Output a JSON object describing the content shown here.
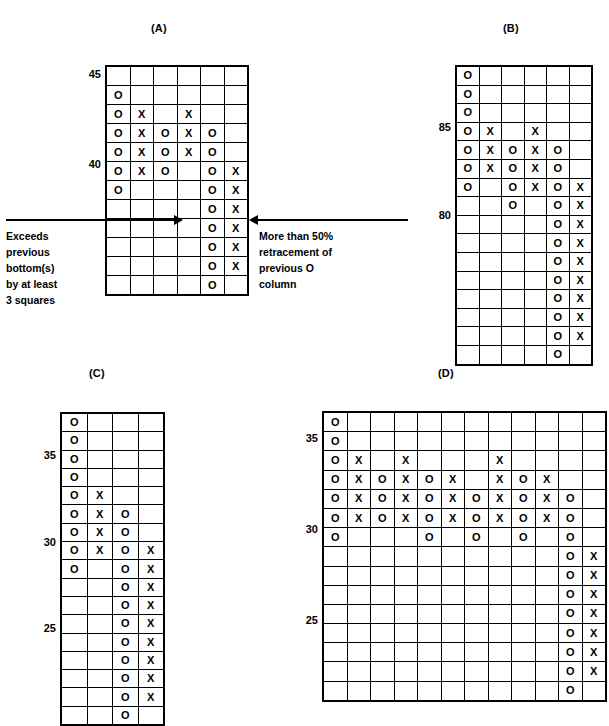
{
  "figure": {
    "type": "point-and-figure-charts",
    "panels": [
      {
        "id": "A",
        "title": "(A)",
        "columns": 6,
        "rows": 12,
        "scale_labels": [
          {
            "text": "45",
            "row": 0
          },
          {
            "text": "40",
            "row": 5
          }
        ],
        "cells": [
          [
            "",
            "",
            "",
            "",
            "",
            ""
          ],
          [
            "O",
            "",
            "",
            "",
            "",
            ""
          ],
          [
            "O",
            "X",
            "",
            "X",
            "",
            ""
          ],
          [
            "O",
            "X",
            "O",
            "X",
            "O",
            ""
          ],
          [
            "O",
            "X",
            "O",
            "X",
            "O",
            ""
          ],
          [
            "O",
            "X",
            "O",
            "",
            "O",
            "X"
          ],
          [
            "O",
            "",
            "",
            "",
            "O",
            "X"
          ],
          [
            "",
            "",
            "",
            "",
            "O",
            "X"
          ],
          [
            "",
            "",
            "",
            "",
            "O",
            "X"
          ],
          [
            "",
            "",
            "",
            "",
            "O",
            "X"
          ],
          [
            "",
            "",
            "",
            "",
            "O",
            "X"
          ],
          [
            "",
            "",
            "",
            "",
            "O",
            ""
          ]
        ]
      },
      {
        "id": "B",
        "title": "(B)",
        "columns": 6,
        "rows": 16,
        "scale_labels": [
          {
            "text": "85",
            "row": 3
          },
          {
            "text": "80",
            "row": 8
          }
        ],
        "cells": [
          [
            "O",
            "",
            "",
            "",
            "",
            ""
          ],
          [
            "O",
            "",
            "",
            "",
            "",
            ""
          ],
          [
            "O",
            "",
            "",
            "",
            "",
            ""
          ],
          [
            "O",
            "X",
            "",
            "X",
            "",
            ""
          ],
          [
            "O",
            "X",
            "O",
            "X",
            "O",
            ""
          ],
          [
            "O",
            "X",
            "O",
            "X",
            "O",
            ""
          ],
          [
            "O",
            "",
            "O",
            "X",
            "O",
            "X"
          ],
          [
            "",
            "",
            "O",
            "",
            "O",
            "X"
          ],
          [
            "",
            "",
            "",
            "",
            "O",
            "X"
          ],
          [
            "",
            "",
            "",
            "",
            "O",
            "X"
          ],
          [
            "",
            "",
            "",
            "",
            "O",
            "X"
          ],
          [
            "",
            "",
            "",
            "",
            "O",
            "X"
          ],
          [
            "",
            "",
            "",
            "",
            "O",
            "X"
          ],
          [
            "",
            "",
            "",
            "",
            "O",
            "X"
          ],
          [
            "",
            "",
            "",
            "",
            "O",
            "X"
          ],
          [
            "",
            "",
            "",
            "",
            "O",
            ""
          ]
        ]
      },
      {
        "id": "C",
        "title": "(C)",
        "columns": 4,
        "rows": 17,
        "scale_labels": [
          {
            "text": "35",
            "row": 2
          },
          {
            "text": "30",
            "row": 7
          },
          {
            "text": "25",
            "row": 12
          }
        ],
        "cells": [
          [
            "O",
            "",
            "",
            ""
          ],
          [
            "O",
            "",
            "",
            ""
          ],
          [
            "O",
            "",
            "",
            ""
          ],
          [
            "O",
            "",
            "",
            ""
          ],
          [
            "O",
            "X",
            "",
            ""
          ],
          [
            "O",
            "X",
            "O",
            ""
          ],
          [
            "O",
            "X",
            "O",
            ""
          ],
          [
            "O",
            "X",
            "O",
            "X"
          ],
          [
            "O",
            "",
            "O",
            "X"
          ],
          [
            "",
            "",
            "O",
            "X"
          ],
          [
            "",
            "",
            "O",
            "X"
          ],
          [
            "",
            "",
            "O",
            "X"
          ],
          [
            "",
            "",
            "O",
            "X"
          ],
          [
            "",
            "",
            "O",
            "X"
          ],
          [
            "",
            "",
            "O",
            "X"
          ],
          [
            "",
            "",
            "O",
            "X"
          ],
          [
            "",
            "",
            "O",
            ""
          ]
        ]
      },
      {
        "id": "D",
        "title": "(D)",
        "columns": 12,
        "rows": 15,
        "scale_labels": [
          {
            "text": "35",
            "row": 1
          },
          {
            "text": "30",
            "row": 6
          },
          {
            "text": "25",
            "row": 11
          }
        ],
        "cells": [
          [
            "O",
            "",
            "",
            "",
            "",
            "",
            "",
            "",
            "",
            "",
            "",
            ""
          ],
          [
            "O",
            "",
            "",
            "",
            "",
            "",
            "",
            "",
            "",
            "",
            "",
            ""
          ],
          [
            "O",
            "X",
            "",
            "X",
            "",
            "",
            "",
            "X",
            "",
            "",
            "",
            ""
          ],
          [
            "O",
            "X",
            "O",
            "X",
            "O",
            "X",
            "",
            "X",
            "O",
            "X",
            "",
            ""
          ],
          [
            "O",
            "X",
            "O",
            "X",
            "O",
            "X",
            "O",
            "X",
            "O",
            "X",
            "O",
            ""
          ],
          [
            "O",
            "X",
            "O",
            "X",
            "O",
            "X",
            "O",
            "X",
            "O",
            "X",
            "O",
            ""
          ],
          [
            "O",
            "",
            "",
            "",
            "O",
            "",
            "O",
            "",
            "O",
            "",
            "O",
            ""
          ],
          [
            "",
            "",
            "",
            "",
            "",
            "",
            "",
            "",
            "",
            "",
            "O",
            "X"
          ],
          [
            "",
            "",
            "",
            "",
            "",
            "",
            "",
            "",
            "",
            "",
            "O",
            "X"
          ],
          [
            "",
            "",
            "",
            "",
            "",
            "",
            "",
            "",
            "",
            "",
            "O",
            "X"
          ],
          [
            "",
            "",
            "",
            "",
            "",
            "",
            "",
            "",
            "",
            "",
            "O",
            "X"
          ],
          [
            "",
            "",
            "",
            "",
            "",
            "",
            "",
            "",
            "",
            "",
            "O",
            "X"
          ],
          [
            "",
            "",
            "",
            "",
            "",
            "",
            "",
            "",
            "",
            "",
            "O",
            "X"
          ],
          [
            "",
            "",
            "",
            "",
            "",
            "",
            "",
            "",
            "",
            "",
            "O",
            "X"
          ],
          [
            "",
            "",
            "",
            "",
            "",
            "",
            "",
            "",
            "",
            "",
            "O",
            ""
          ]
        ]
      }
    ],
    "annotations": {
      "left": {
        "text": "Exceeds\nprevious\nbottom(s)\nby at least\n3 squares",
        "lines": [
          "Exceeds",
          "previous",
          "bottom(s)",
          "by at least",
          "3 squares"
        ]
      },
      "right": {
        "text": "More than 50%\nretracement of\nprevious O\ncolumn",
        "lines": [
          "More than 50%",
          "retracement of",
          "previous O",
          "column"
        ]
      }
    },
    "marks": {
      "o": "O",
      "x": "X"
    },
    "colors": {
      "ink": "#000000",
      "background": "#ffffff"
    }
  }
}
